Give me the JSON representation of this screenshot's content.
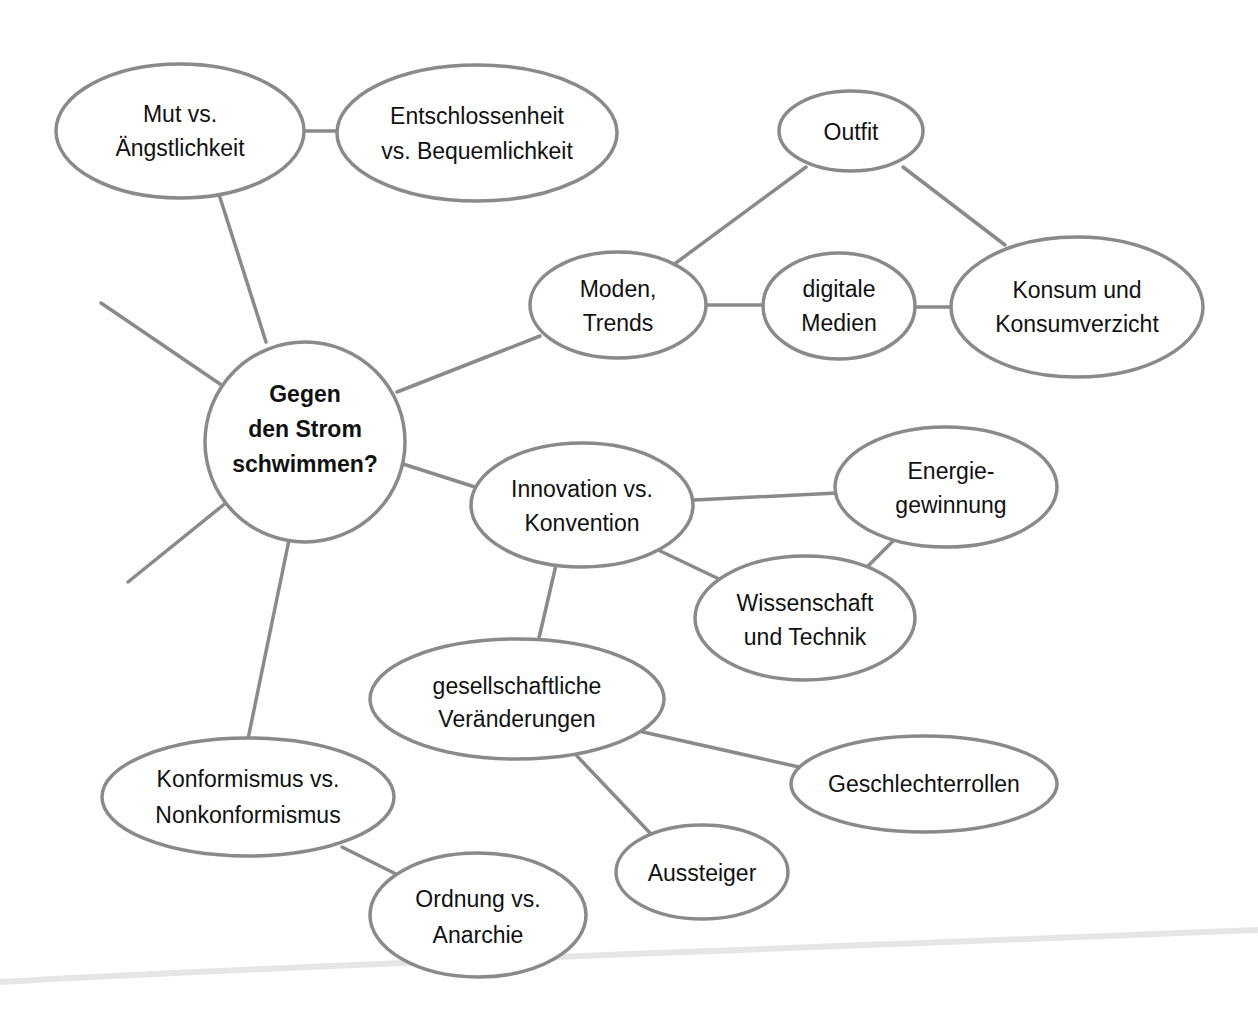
{
  "diagram": {
    "type": "mind-map",
    "colors": {
      "stroke": "#8a8a8a",
      "text": "#111111",
      "background": "#ffffff"
    },
    "center": {
      "id": "center",
      "lines": [
        "Gegen",
        "den Strom",
        "schwimmen?"
      ]
    },
    "nodes": [
      {
        "id": "mut",
        "lines": [
          "Mut vs.",
          "Ängstlichkeit"
        ]
      },
      {
        "id": "entschlossenheit",
        "lines": [
          "Entschlossenheit",
          "vs. Bequemlichkeit"
        ]
      },
      {
        "id": "outfit",
        "lines": [
          "Outfit"
        ]
      },
      {
        "id": "moden",
        "lines": [
          "Moden,",
          "Trends"
        ]
      },
      {
        "id": "digitale",
        "lines": [
          "digitale",
          "Medien"
        ]
      },
      {
        "id": "konsum",
        "lines": [
          "Konsum und",
          "Konsumverzicht"
        ]
      },
      {
        "id": "innovation",
        "lines": [
          "Innovation vs.",
          "Konvention"
        ]
      },
      {
        "id": "energie",
        "lines": [
          "Energie-",
          "gewinnung"
        ]
      },
      {
        "id": "wissenschaft",
        "lines": [
          "Wissenschaft",
          "und Technik"
        ]
      },
      {
        "id": "gesellschaft",
        "lines": [
          "gesellschaftliche",
          "Veränderungen"
        ]
      },
      {
        "id": "geschlechter",
        "lines": [
          "Geschlechterrollen"
        ]
      },
      {
        "id": "aussteiger",
        "lines": [
          "Aussteiger"
        ]
      },
      {
        "id": "konformismus",
        "lines": [
          "Konformismus vs.",
          "Nonkonformismus"
        ]
      },
      {
        "id": "ordnung",
        "lines": [
          "Ordnung vs.",
          "Anarchie"
        ]
      }
    ],
    "edges": [
      {
        "from": "center",
        "to": "mut"
      },
      {
        "from": "mut",
        "to": "entschlossenheit"
      },
      {
        "from": "center",
        "to": "moden"
      },
      {
        "from": "moden",
        "to": "outfit"
      },
      {
        "from": "moden",
        "to": "digitale"
      },
      {
        "from": "digitale",
        "to": "konsum"
      },
      {
        "from": "outfit",
        "to": "konsum"
      },
      {
        "from": "center",
        "to": "innovation"
      },
      {
        "from": "innovation",
        "to": "energie"
      },
      {
        "from": "innovation",
        "to": "wissenschaft"
      },
      {
        "from": "energie",
        "to": "wissenschaft"
      },
      {
        "from": "innovation",
        "to": "gesellschaft"
      },
      {
        "from": "gesellschaft",
        "to": "geschlechter"
      },
      {
        "from": "gesellschaft",
        "to": "aussteiger"
      },
      {
        "from": "center",
        "to": "konformismus"
      },
      {
        "from": "konformismus",
        "to": "ordnung"
      },
      {
        "from": "center",
        "to": "(open branch upper-left)"
      },
      {
        "from": "center",
        "to": "(open branch lower-left)"
      }
    ]
  }
}
